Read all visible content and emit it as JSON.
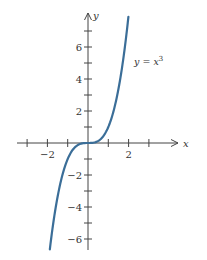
{
  "chart_data": {
    "type": "line",
    "title": "",
    "xlabel": "x",
    "ylabel": "y",
    "xlim": [
      -3,
      4.3
    ],
    "ylim": [
      -6.8,
      8
    ],
    "x_ticks": [
      -3,
      -2,
      -1,
      0,
      1,
      2,
      3
    ],
    "x_tick_labels": [
      {
        "value": -2,
        "text": "−2"
      },
      {
        "value": 2,
        "text": "2"
      }
    ],
    "y_ticks": [
      -6,
      -5,
      -4,
      -3,
      -2,
      -1,
      1,
      2,
      3,
      4,
      5,
      6,
      7
    ],
    "y_tick_labels": [
      {
        "value": 6,
        "text": "6"
      },
      {
        "value": 4,
        "text": "4"
      },
      {
        "value": 2,
        "text": "2"
      },
      {
        "value": -2,
        "text": "−2"
      },
      {
        "value": -4,
        "text": "−4"
      },
      {
        "value": -6,
        "text": "−6"
      }
    ],
    "grid": false,
    "series": [
      {
        "name": "y = x^3",
        "label": "y = x³",
        "color": "#3b6e98",
        "x": [
          -1.88,
          -1.75,
          -1.5,
          -1.25,
          -1.0,
          -0.75,
          -0.5,
          -0.25,
          0,
          0.25,
          0.5,
          0.75,
          1.0,
          1.25,
          1.5,
          1.75,
          1.99
        ],
        "y": [
          -6.64,
          -5.36,
          -3.375,
          -1.953,
          -1.0,
          -0.422,
          -0.125,
          -0.016,
          0,
          0.016,
          0.125,
          0.422,
          1.0,
          1.953,
          3.375,
          5.36,
          7.88
        ]
      }
    ],
    "annotations": [
      {
        "text": "y = x³",
        "x": 2.2,
        "y": 5.2
      }
    ]
  },
  "labels": {
    "x_axis": "x",
    "y_axis": "y",
    "function_label_prefix": "y = x",
    "function_label_exp": "3"
  }
}
